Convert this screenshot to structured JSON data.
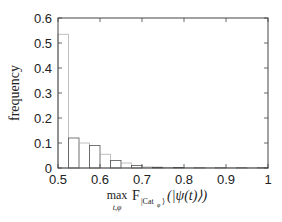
{
  "chart_data": {
    "type": "bar",
    "subtype": "histogram",
    "title": "",
    "xlabel": "max_{t,φ} F_{|Cat_φ⟩}(|ψ(t)⟩)",
    "xlabel_parts": {
      "max": "max",
      "sub": "t,φ",
      "F": "F",
      "Fsub": "|Cat",
      "Fsubsub": "φ",
      "Fsubclose": "⟩",
      "arg": "(|ψ(t)⟩)"
    },
    "ylabel": "frequency",
    "xlim": [
      0.5,
      1.0
    ],
    "ylim": [
      0,
      0.6
    ],
    "xticks": [
      "0.5",
      "0.6",
      "0.7",
      "0.8",
      "0.9",
      "1"
    ],
    "yticks": [
      "0",
      "0.1",
      "0.2",
      "0.3",
      "0.4",
      "0.5",
      "0.6"
    ],
    "grid": false,
    "legend": null,
    "bin_width": 0.025,
    "bin_starts": [
      0.5,
      0.525,
      0.55,
      0.575,
      0.6,
      0.625,
      0.65,
      0.675,
      0.7,
      0.725,
      0.75,
      0.775,
      0.8,
      0.825,
      0.85,
      0.875,
      0.9,
      0.925,
      0.95,
      0.975
    ],
    "values": [
      0.535,
      0.12,
      0.1,
      0.09,
      0.055,
      0.03,
      0.02,
      0.01,
      0.004,
      0.003,
      0.002,
      0.002,
      0.001,
      0.001,
      0.001,
      0.001,
      0.001,
      0.001,
      0.001,
      0.001
    ]
  },
  "colors": {
    "bar_edge": "#b0b0b0",
    "bar_edge_dark": "#555555",
    "axis": "#444444",
    "text": "#222222"
  }
}
